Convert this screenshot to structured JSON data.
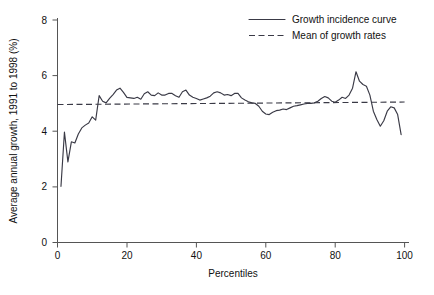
{
  "chart_data": {
    "type": "line",
    "title": "",
    "xlabel": "Percentiles",
    "ylabel": "Average annual growth, 1991 to 1998 (%)",
    "xlim": [
      0,
      100
    ],
    "ylim": [
      0,
      8
    ],
    "xticks": [
      0,
      20,
      40,
      60,
      80,
      100
    ],
    "yticks": [
      0,
      2,
      4,
      6,
      8
    ],
    "xtick_labels": [
      "0",
      "20",
      "40",
      "60",
      "80",
      "100"
    ],
    "ytick_labels": [
      "0",
      "2",
      "4",
      "6",
      "8"
    ],
    "grid": false,
    "legend_position": "top-right",
    "series": [
      {
        "name": "Growth incidence curve",
        "style": "solid",
        "color": "#3a3a46",
        "x": [
          1,
          2,
          3,
          4,
          5,
          6,
          7,
          8,
          9,
          10,
          11,
          12,
          13,
          14,
          15,
          16,
          17,
          18,
          19,
          20,
          21,
          22,
          23,
          24,
          25,
          26,
          27,
          28,
          29,
          30,
          31,
          32,
          33,
          34,
          35,
          36,
          37,
          38,
          39,
          40,
          41,
          42,
          43,
          44,
          45,
          46,
          47,
          48,
          49,
          50,
          51,
          52,
          53,
          54,
          55,
          56,
          57,
          58,
          59,
          60,
          61,
          62,
          63,
          64,
          65,
          66,
          67,
          68,
          69,
          70,
          71,
          72,
          73,
          74,
          75,
          76,
          77,
          78,
          79,
          80,
          81,
          82,
          83,
          84,
          85,
          86,
          87,
          88,
          89,
          90,
          91,
          92,
          93,
          94,
          95,
          96,
          97,
          98,
          99
        ],
        "y": [
          2.02,
          3.97,
          2.9,
          3.62,
          3.58,
          3.9,
          4.12,
          4.22,
          4.3,
          4.52,
          4.4,
          5.28,
          5.08,
          5.02,
          5.18,
          5.32,
          5.48,
          5.55,
          5.4,
          5.22,
          5.2,
          5.18,
          5.22,
          5.15,
          5.35,
          5.42,
          5.3,
          5.28,
          5.38,
          5.3,
          5.3,
          5.36,
          5.36,
          5.28,
          5.22,
          5.42,
          5.48,
          5.3,
          5.22,
          5.18,
          5.12,
          5.16,
          5.2,
          5.26,
          5.38,
          5.42,
          5.38,
          5.3,
          5.32,
          5.28,
          5.36,
          5.36,
          5.2,
          5.12,
          5.06,
          5.02,
          5.0,
          4.9,
          4.72,
          4.62,
          4.6,
          4.68,
          4.74,
          4.76,
          4.8,
          4.78,
          4.84,
          4.9,
          4.92,
          4.95,
          4.98,
          5.0,
          5.0,
          5.02,
          5.08,
          5.18,
          5.25,
          5.2,
          5.08,
          5.04,
          5.12,
          5.22,
          5.18,
          5.3,
          5.55,
          6.14,
          5.8,
          5.68,
          5.62,
          5.3,
          4.72,
          4.42,
          4.18,
          4.38,
          4.72,
          4.88,
          4.84,
          4.6,
          3.88
        ]
      },
      {
        "name": "Mean of growth rates",
        "style": "dashed",
        "color": "#3a3a46",
        "x": [
          0,
          100
        ],
        "y": [
          4.96,
          5.05
        ]
      }
    ],
    "legend": [
      {
        "label": "Growth incidence curve",
        "style": "solid"
      },
      {
        "label": "Mean of growth rates",
        "style": "dashed"
      }
    ]
  }
}
